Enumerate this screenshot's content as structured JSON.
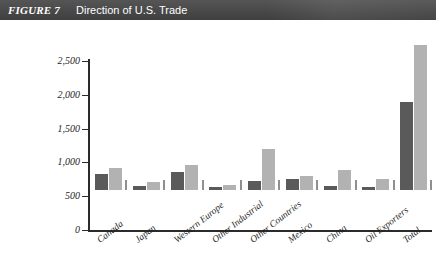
{
  "header": {
    "figure_number": "FIGURE 7",
    "title": "Direction of U.S. Trade"
  },
  "colors": {
    "header_bar": "#4a4a4a",
    "series_dark": "#5a5a5a",
    "series_light": "#b2b2b2",
    "axis": "#2b2b2b",
    "background": "#ffffff"
  },
  "chart_data": {
    "type": "bar",
    "title": "Direction of U.S. Trade",
    "xlabel": "",
    "ylabel": "",
    "ylim": [
      0,
      2500
    ],
    "yticks": [
      0,
      500,
      1000,
      1500,
      2000,
      2500
    ],
    "ytick_labels": [
      "0",
      "500",
      "1,000",
      "1,500",
      "2,000",
      "2,500"
    ],
    "grid": false,
    "legend": "none",
    "categories": [
      "Canada",
      "Japan",
      "Western Europe",
      "Other Industrial",
      "Other Countries",
      "Mexico",
      "China",
      "Oil Exporters",
      "Total"
    ],
    "series": [
      {
        "name": "series-dark",
        "values": [
          230,
          60,
          270,
          40,
          130,
          160,
          60,
          40,
          1300
        ]
      },
      {
        "name": "series-light",
        "values": [
          320,
          120,
          370,
          70,
          610,
          210,
          300,
          170,
          2150
        ]
      }
    ]
  }
}
